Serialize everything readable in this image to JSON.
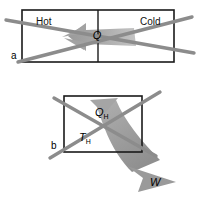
{
  "figure": {
    "colors": {
      "outline": "#1a1a1a",
      "arrow_fill": "#9a9a9a",
      "arrow_fill_light": "#b6b6b6",
      "cross_stroke": "#8c8c8c",
      "text": "#000000",
      "background": "#ffffff"
    },
    "panels": [
      {
        "id": "panel-a",
        "label": "a",
        "box": {
          "x": 22,
          "y": 10,
          "width": 152,
          "height": 52
        },
        "divider_x": 98,
        "labels": [
          {
            "name": "hot-label",
            "text": "Hot",
            "style": "plain",
            "x": 36,
            "y": 25
          },
          {
            "name": "cold-label",
            "text": "Cold",
            "style": "plain",
            "x": 140,
            "y": 25
          },
          {
            "name": "heat-flow-label",
            "text": "Q",
            "style": "italic",
            "x": 97,
            "y": 39
          }
        ],
        "arrow": {
          "name": "heat-flow-arrow",
          "direction": "left",
          "description": "broad gray arrow spanning the divider, pointing from Cold side toward Hot side"
        },
        "cross": {
          "name": "forbidden-cross",
          "description": "two gray strokes crossing in an X over the box, extending past its edges"
        }
      },
      {
        "id": "panel-b",
        "label": "b",
        "box": {
          "x": 64,
          "y": 96,
          "width": 78,
          "height": 56
        },
        "labels": [
          {
            "name": "heat-in-label",
            "text": "Q",
            "subscript": "H",
            "style": "italic",
            "x": 95,
            "y": 116
          },
          {
            "name": "temperature-label",
            "text": "T",
            "subscript": "H",
            "style": "italic",
            "x": 79,
            "y": 141
          },
          {
            "name": "work-label",
            "text": "W",
            "style": "italic",
            "x": 150,
            "y": 186
          }
        ],
        "arrow": {
          "name": "work-output-arrow",
          "direction": "down-right",
          "description": "thick curved gray band leaving the box bottom-right and ending in an arrowhead labeled W"
        },
        "cross": {
          "name": "forbidden-cross",
          "description": "two gray strokes crossing in an X over the box, extending past its edges"
        }
      }
    ]
  }
}
